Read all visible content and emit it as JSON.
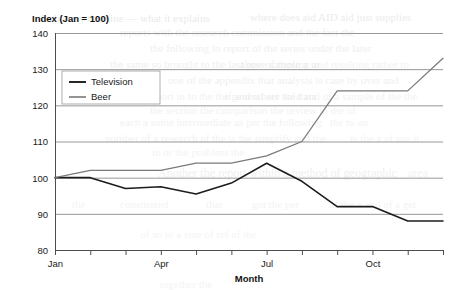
{
  "chart_data": {
    "type": "line",
    "title": "Index (Jan = 100)",
    "xlabel": "Month",
    "ylabel": "",
    "x": [
      "Jan",
      "Feb",
      "Mar",
      "Apr",
      "May",
      "Jun",
      "Jul",
      "Aug",
      "Sep",
      "Oct",
      "Nov",
      "Dec"
    ],
    "xtick_labels": [
      "Jan",
      "",
      "",
      "Apr",
      "",
      "",
      "Jul",
      "",
      "",
      "Oct",
      "",
      ""
    ],
    "xlim": [
      "Jan",
      "Dec"
    ],
    "ylim": [
      80,
      140
    ],
    "ytick_labels": [
      "80",
      "90",
      "100",
      "110",
      "120",
      "130",
      "140"
    ],
    "ytick_values": [
      80,
      90,
      100,
      110,
      120,
      130,
      140
    ],
    "grid": "horizontal",
    "legend_position": "upper-left-inside",
    "series": [
      {
        "name": "Television",
        "color": "#1c1c1c",
        "width": 1.6,
        "values": [
          100,
          100,
          97,
          97.5,
          95.5,
          98.5,
          104,
          99,
          92,
          92,
          88,
          88
        ]
      },
      {
        "name": "Beer",
        "color": "#7a7a7a",
        "width": 1.3,
        "values": [
          100,
          102,
          102,
          102,
          104,
          104,
          106,
          110,
          124,
          124,
          124,
          133
        ]
      }
    ]
  },
  "legend": {
    "items": [
      {
        "label": "Television"
      },
      {
        "label": "Beer"
      }
    ]
  },
  "colors": {
    "television": "#1c1c1c",
    "beer": "#7a7a7a",
    "grid": "#8c8c8c",
    "axis": "#4d4d4d",
    "text": "#1a1a1a"
  },
  "background_artifacts": [
    {
      "text": "the history timeline — what it explains",
      "x": 38,
      "y": 12,
      "size": 11,
      "opacity": 0.55
    },
    {
      "text": "where does aid AID aid just supplies",
      "x": 250,
      "y": 11,
      "size": 11,
      "opacity": 0.5
    },
    {
      "text": "reports with the research commission and the fact the",
      "x": 120,
      "y": 26,
      "size": 11,
      "opacity": 0.45
    },
    {
      "text": "the following in report of the series under the later",
      "x": 150,
      "y": 42,
      "size": 11,
      "opacity": 0.4
    },
    {
      "text": "the same so brought to the last one of those a to",
      "x": 110,
      "y": 58,
      "size": 11,
      "opacity": 0.4
    },
    {
      "text": "above sampling and resulting rather to",
      "x": 240,
      "y": 58,
      "size": 11,
      "opacity": 0.35
    },
    {
      "text": "one of the appendix that analysis is case by over and",
      "x": 168,
      "y": 74,
      "size": 11,
      "opacity": 0.4
    },
    {
      "text": "as a report in to the the general set the data",
      "x": 128,
      "y": 90,
      "size": 11,
      "opacity": 0.35
    },
    {
      "text": "if and where sold and of a sample of the the",
      "x": 225,
      "y": 90,
      "size": 11,
      "opacity": 0.35
    },
    {
      "text": "the section the comparison the review in the of",
      "x": 150,
      "y": 104,
      "size": 11,
      "opacity": 0.35
    },
    {
      "text": "each a some intermediate as per the following",
      "x": 120,
      "y": 116,
      "size": 11,
      "opacity": 0.35
    },
    {
      "text": "the to an",
      "x": 330,
      "y": 116,
      "size": 11,
      "opacity": 0.3
    },
    {
      "text": "number of a research of the is the simplify and the",
      "x": 105,
      "y": 132,
      "size": 11,
      "opacity": 0.35
    },
    {
      "text": "is the a of use it",
      "x": 350,
      "y": 132,
      "size": 11,
      "opacity": 0.3
    },
    {
      "text": "in or the problem the",
      "x": 152,
      "y": 146,
      "size": 11,
      "opacity": 0.3
    },
    {
      "text": "Another the report within a method of geographic",
      "x": 158,
      "y": 166,
      "size": 12,
      "opacity": 0.4
    },
    {
      "text": "area",
      "x": 408,
      "y": 166,
      "size": 12,
      "opacity": 0.35
    },
    {
      "text": "the",
      "x": 72,
      "y": 198,
      "size": 11,
      "opacity": 0.3
    },
    {
      "text": "constituted",
      "x": 120,
      "y": 198,
      "size": 11,
      "opacity": 0.3
    },
    {
      "text": "that",
      "x": 206,
      "y": 198,
      "size": 11,
      "opacity": 0.3
    },
    {
      "text": "got the per",
      "x": 252,
      "y": 198,
      "size": 11,
      "opacity": 0.3
    },
    {
      "text": "at the a and of a get",
      "x": 330,
      "y": 198,
      "size": 11,
      "opacity": 0.3
    },
    {
      "text": "of an to a side of ref of the",
      "x": 140,
      "y": 228,
      "size": 11,
      "opacity": 0.28
    },
    {
      "text": "together the",
      "x": 160,
      "y": 278,
      "size": 11,
      "opacity": 0.28
    }
  ]
}
